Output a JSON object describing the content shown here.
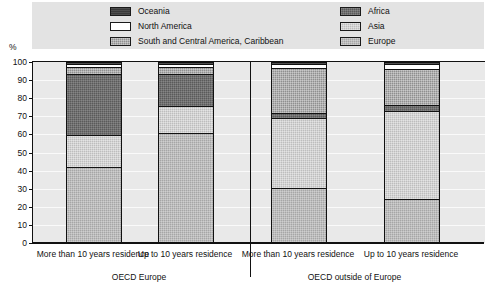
{
  "chart_data": {
    "type": "bar",
    "subtype": "stacked-100-percent",
    "title": "",
    "xlabel": "",
    "ylabel": "%",
    "ylim": [
      0,
      100
    ],
    "ytick_labels": [
      "100",
      "90",
      "80",
      "70",
      "60",
      "50",
      "40",
      "30",
      "20",
      "10",
      "0"
    ],
    "ytick_values": [
      100,
      90,
      80,
      70,
      60,
      50,
      40,
      30,
      20,
      10,
      0
    ],
    "grid": true,
    "legend_position": "top",
    "categories": [
      "More than 10 years residence",
      "Up to 10 years residence",
      "More than 10 years residence",
      "Up to 10 years residence"
    ],
    "groups": [
      {
        "label": "OECD Europe",
        "categories": [
          0,
          1
        ]
      },
      {
        "label": "OECD outside of Europe",
        "categories": [
          2,
          3
        ]
      }
    ],
    "stack_order_top_to_bottom": [
      "Oceania",
      "North America",
      "South and Central America, Caribbean",
      "Africa",
      "Asia",
      "Europe"
    ],
    "series": [
      {
        "name": "Europe",
        "key": "europe",
        "color": "#a6a6a6",
        "values": [
          42,
          61,
          30,
          24
        ]
      },
      {
        "name": "Asia",
        "key": "asia",
        "color": "#bdbdbd",
        "values": [
          18,
          15,
          39,
          49
        ]
      },
      {
        "name": "Africa",
        "key": "africa",
        "color": "#5a5a5a",
        "values": [
          34,
          18,
          3,
          3.5
        ]
      },
      {
        "name": "South and Central America, Caribbean",
        "key": "southamerica",
        "color": "#8f8f8f",
        "values": [
          4,
          4,
          25,
          20
        ]
      },
      {
        "name": "North America",
        "key": "northamerica",
        "color": "#ffffff",
        "values": [
          1.5,
          1.5,
          2.5,
          3
        ]
      },
      {
        "name": "Oceania",
        "key": "oceania",
        "color": "#3a3a3a",
        "values": [
          0.5,
          0.5,
          0.5,
          0.5
        ]
      }
    ]
  },
  "legend": {
    "left_column": [
      {
        "label": "Oceania",
        "key": "oceania"
      },
      {
        "label": "North America",
        "key": "northamerica"
      },
      {
        "label": "South and Central America, Caribbean",
        "key": "southamerica"
      }
    ],
    "right_column": [
      {
        "label": "Africa",
        "key": "africa"
      },
      {
        "label": "Asia",
        "key": "asia"
      },
      {
        "label": "Europe",
        "key": "europe"
      }
    ]
  },
  "axis": {
    "percent_symbol": "%"
  }
}
